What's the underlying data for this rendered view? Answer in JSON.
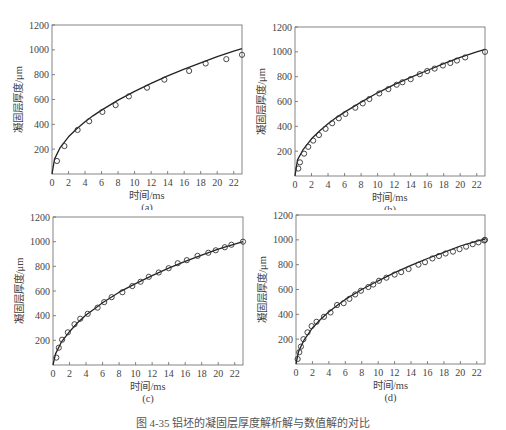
{
  "figure": {
    "caption": "图 4-35  铝坯的凝固层厚度解析解与数值解的对比"
  },
  "chart_data": [
    {
      "id": "a",
      "type": "line",
      "panel_label": "(a)",
      "xlabel": "时间/ms",
      "ylabel": "凝固层厚度/μm",
      "xlim": [
        0,
        23
      ],
      "ylim": [
        0,
        1200
      ],
      "xticks": [
        0,
        2,
        4,
        6,
        8,
        10,
        12,
        14,
        16,
        18,
        20,
        22
      ],
      "yticks": [
        200,
        400,
        600,
        800,
        1000,
        1200
      ],
      "ytick_zero_label": "0",
      "grid": false,
      "series": [
        {
          "name": "解析解",
          "style": "line",
          "x": [
            0,
            0.3,
            1,
            2,
            3,
            4,
            5,
            6,
            8,
            10,
            12,
            14,
            16,
            18,
            20,
            22,
            23
          ],
          "y": [
            0,
            120,
            215,
            300,
            365,
            420,
            470,
            515,
            595,
            665,
            730,
            790,
            845,
            895,
            945,
            990,
            1010
          ]
        },
        {
          "name": "数值解",
          "style": "marker-circle",
          "x": [
            0.6,
            1.5,
            3.1,
            4.5,
            6.1,
            7.7,
            9.3,
            11.5,
            13.6,
            16.6,
            18.6,
            21.1,
            23
          ],
          "y": [
            105,
            225,
            355,
            425,
            500,
            555,
            625,
            695,
            760,
            830,
            890,
            925,
            960
          ]
        }
      ]
    },
    {
      "id": "b",
      "type": "line",
      "panel_label": "(b)",
      "xlabel": "时间/ms",
      "ylabel": "凝固层厚度/μm",
      "xlim": [
        0,
        23
      ],
      "ylim": [
        0,
        1200
      ],
      "xticks": [
        0,
        2,
        4,
        6,
        8,
        10,
        12,
        14,
        16,
        18,
        20,
        22
      ],
      "yticks": [
        200,
        400,
        600,
        800,
        1000,
        1200
      ],
      "ytick_zero_label": "0",
      "grid": false,
      "series": [
        {
          "name": "解析解",
          "style": "line",
          "x": [
            0,
            0.3,
            1,
            2,
            3,
            4,
            5,
            6,
            8,
            10,
            12,
            14,
            16,
            18,
            20,
            22,
            23
          ],
          "y": [
            0,
            130,
            215,
            300,
            365,
            420,
            470,
            515,
            595,
            670,
            735,
            795,
            850,
            905,
            955,
            1000,
            1020
          ]
        },
        {
          "name": "数值解",
          "style": "marker-circle",
          "x": [
            0.4,
            0.6,
            1.1,
            1.6,
            2.2,
            2.9,
            3.7,
            4.5,
            5.3,
            6.1,
            7.3,
            8.2,
            9.0,
            10.2,
            11.3,
            12.3,
            13.0,
            14.0,
            15.1,
            16.0,
            16.9,
            17.9,
            18.8,
            19.6,
            20.6,
            23.0
          ],
          "y": [
            60,
            110,
            180,
            235,
            285,
            330,
            380,
            425,
            465,
            500,
            550,
            585,
            620,
            665,
            700,
            735,
            755,
            780,
            820,
            845,
            865,
            890,
            910,
            930,
            955,
            1000
          ]
        }
      ]
    },
    {
      "id": "c",
      "type": "line",
      "panel_label": "(c)",
      "xlabel": "时间/ms",
      "ylabel": "凝固层厚度/μm",
      "xlim": [
        0,
        23
      ],
      "ylim": [
        0,
        1200
      ],
      "xticks": [
        0,
        2,
        4,
        6,
        8,
        10,
        12,
        14,
        16,
        18,
        20,
        22
      ],
      "yticks": [
        200,
        400,
        600,
        800,
        1000,
        1200
      ],
      "ytick_zero_label": "0",
      "grid": false,
      "series": [
        {
          "name": "解析解",
          "style": "line",
          "x": [
            0,
            0.3,
            1,
            2,
            3,
            4,
            5,
            6,
            8,
            10,
            12,
            14,
            16,
            18,
            20,
            22,
            23
          ],
          "y": [
            0,
            90,
            185,
            270,
            345,
            405,
            455,
            505,
            590,
            660,
            725,
            785,
            840,
            890,
            940,
            980,
            1000
          ]
        },
        {
          "name": "数值解",
          "style": "marker-circle",
          "x": [
            0.4,
            0.7,
            1.1,
            1.8,
            2.6,
            3.3,
            4.2,
            5.4,
            6.2,
            7.1,
            8.4,
            9.6,
            10.6,
            11.6,
            12.8,
            14.0,
            15.1,
            16.2,
            17.5,
            18.8,
            19.7,
            20.8,
            21.6,
            23.0
          ],
          "y": [
            60,
            140,
            205,
            265,
            330,
            375,
            415,
            465,
            510,
            550,
            590,
            640,
            675,
            715,
            750,
            785,
            825,
            850,
            885,
            910,
            930,
            955,
            975,
            1000
          ]
        }
      ]
    },
    {
      "id": "d",
      "type": "line",
      "panel_label": "(d)",
      "xlabel": "时间/ms",
      "ylabel": "凝固层厚度/μm",
      "xlim": [
        0,
        23
      ],
      "ylim": [
        0,
        1200
      ],
      "xticks": [
        0,
        2,
        4,
        6,
        8,
        10,
        12,
        14,
        16,
        18,
        20,
        22
      ],
      "yticks": [
        200,
        400,
        600,
        800,
        1000,
        1200
      ],
      "ytick_zero_label": "0",
      "grid": false,
      "series": [
        {
          "name": "解析解",
          "style": "line",
          "x": [
            0,
            0.3,
            1,
            2,
            3,
            4,
            5,
            6,
            8,
            10,
            12,
            14,
            16,
            18,
            20,
            22,
            23
          ],
          "y": [
            0,
            100,
            195,
            290,
            360,
            420,
            470,
            520,
            600,
            670,
            735,
            795,
            850,
            900,
            950,
            990,
            1005
          ]
        },
        {
          "name": "数值解",
          "style": "marker-circle",
          "x": [
            0.2,
            0.4,
            0.6,
            0.9,
            1.4,
            1.9,
            2.5,
            3.4,
            4.2,
            5.0,
            5.8,
            6.5,
            7.2,
            7.9,
            8.8,
            9.4,
            10.1,
            11.0,
            12.0,
            12.8,
            13.7,
            14.9,
            15.7,
            16.6,
            17.4,
            18.2,
            19.1,
            19.9,
            20.7,
            21.5,
            22.2,
            22.9,
            23.0
          ],
          "y": [
            40,
            95,
            140,
            200,
            255,
            305,
            340,
            380,
            415,
            475,
            490,
            525,
            560,
            590,
            620,
            640,
            670,
            695,
            720,
            740,
            765,
            800,
            820,
            850,
            870,
            890,
            905,
            925,
            945,
            965,
            980,
            995,
            1000
          ]
        }
      ]
    }
  ]
}
